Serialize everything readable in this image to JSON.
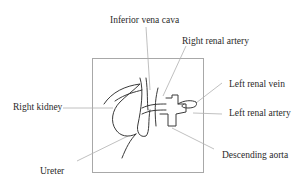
{
  "diagram": {
    "labels": {
      "inferior_vena_cava": "Inferior vena cava",
      "right_renal_artery": "Right renal artery",
      "left_renal_vein": "Left renal vein",
      "left_renal_artery": "Left renal artery",
      "right_kidney": "Right kidney",
      "descending_aorta": "Descending aorta",
      "ureter": "Ureter"
    },
    "colors": {
      "outline": "#3a3a3a",
      "frame": "#a8a8a8",
      "leader": "#b0b0b0",
      "text": "#2a2a2a"
    }
  }
}
